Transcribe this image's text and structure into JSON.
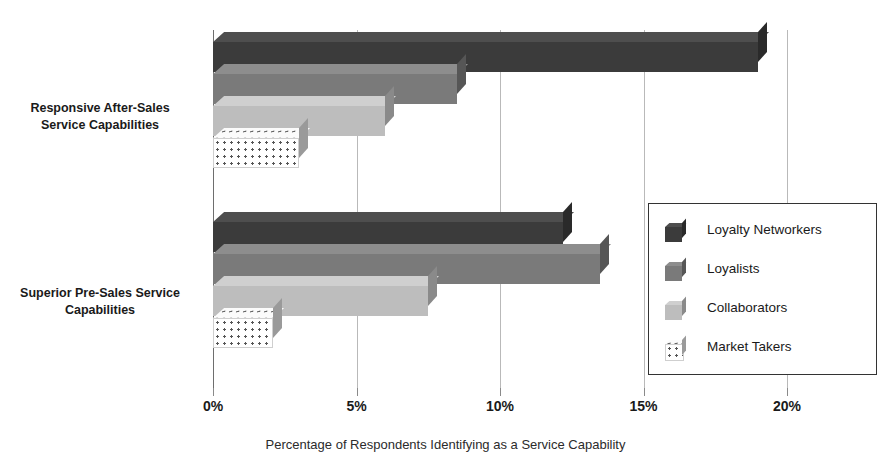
{
  "chart_data": {
    "type": "bar",
    "orientation": "horizontal",
    "title": "",
    "xlabel": "Percentage of Respondents Identifying as a Service Capability",
    "ylabel": "",
    "xlim": [
      0,
      20
    ],
    "xticks": [
      0,
      5,
      10,
      15,
      20
    ],
    "xtick_labels": [
      "0%",
      "5%",
      "10%",
      "15%",
      "20%"
    ],
    "grid": true,
    "grid_axis": "x",
    "legend_position": "right",
    "categories": [
      "Responsive After-Sales Service Capabilities",
      "Superior Pre-Sales Service Capabilities"
    ],
    "category_lines": [
      [
        "Responsive After-Sales",
        "Service Capabilities"
      ],
      [
        "Superior Pre-Sales Service",
        "Capabilities"
      ]
    ],
    "series": [
      {
        "name": "Loyalty Networkers",
        "color": "#3b3b3b",
        "values": [
          19.0,
          12.2
        ]
      },
      {
        "name": "Loyalists",
        "color": "#7a7a7a",
        "values": [
          8.5,
          13.5
        ]
      },
      {
        "name": "Collaborators",
        "color": "#bdbdbd",
        "values": [
          6.0,
          7.5
        ]
      },
      {
        "name": "Market Takers",
        "color": "#ffffff",
        "pattern": "dotted",
        "values": [
          3.0,
          2.1
        ]
      }
    ]
  }
}
